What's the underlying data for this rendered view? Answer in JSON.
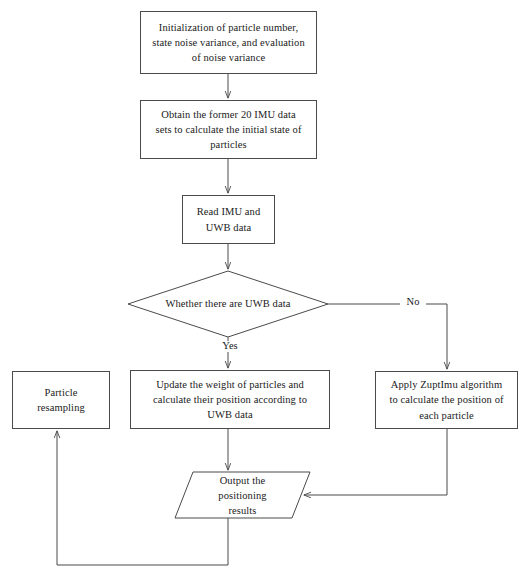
{
  "diagram": {
    "stroke_color": "#4a4a4a",
    "text_color": "#1a1a1a",
    "background": "#ffffff",
    "nodes": [
      {
        "id": "init",
        "shape": "process",
        "text": "Initialization of particle number,\nstate noise variance, and evaluation\nof noise variance"
      },
      {
        "id": "obtain",
        "shape": "process",
        "text": "Obtain the former 20 IMU data\nsets to calculate the initial state of\nparticles"
      },
      {
        "id": "read",
        "shape": "process",
        "text": "Read IMU and\nUWB data"
      },
      {
        "id": "decision",
        "shape": "decision",
        "text": "Whether there are UWB data"
      },
      {
        "id": "resampling",
        "shape": "process",
        "text": "Particle\nresampling"
      },
      {
        "id": "update",
        "shape": "process",
        "text": "Update the weight of particles and\ncalculate their position according to\nUWB data"
      },
      {
        "id": "zupt",
        "shape": "process",
        "text": "Apply ZuptImu algorithm\nto calculate the position of\neach particle"
      },
      {
        "id": "output",
        "shape": "parallelogram",
        "text": "Output the\npositioning\nresults"
      }
    ],
    "edge_labels": {
      "yes": "Yes",
      "no": "No"
    }
  }
}
